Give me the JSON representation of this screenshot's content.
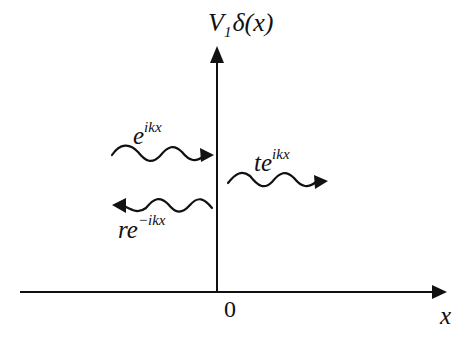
{
  "diagram": {
    "potential_label": {
      "base": "V",
      "subscript": "1",
      "func": "δ(x)"
    },
    "x_axis_label": "x",
    "origin_label": "0",
    "incident_wave": {
      "coef": "",
      "base": "e",
      "exponent": "ikx",
      "direction": "right"
    },
    "reflected_wave": {
      "coef": "r",
      "base": "e",
      "exponent": "−ikx",
      "direction": "left"
    },
    "transmitted_wave": {
      "coef": "t",
      "base": "e",
      "exponent": "ikx",
      "direction": "right"
    },
    "colors": {
      "stroke": "#111111",
      "background": "#ffffff"
    }
  }
}
